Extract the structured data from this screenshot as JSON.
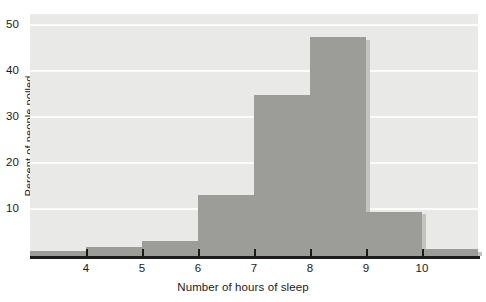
{
  "chart_data": {
    "type": "bar",
    "title": "",
    "xlabel": "Number of hours of sleep",
    "ylabel": "Percent of people polled",
    "categories": [
      "3-4",
      "4-5",
      "5-6",
      "6-7",
      "7-8",
      "8-9",
      "9-10",
      "10-11"
    ],
    "bin_edges": [
      3,
      4,
      5,
      6,
      7,
      8,
      9,
      10,
      11
    ],
    "values": [
      1,
      2,
      3.3,
      13.2,
      35,
      47.5,
      9.6,
      1.5
    ],
    "x_tick_labels": [
      "4",
      "5",
      "6",
      "7",
      "8",
      "9",
      "10"
    ],
    "x_tick_values": [
      4,
      5,
      6,
      7,
      8,
      9,
      10
    ],
    "y_tick_labels": [
      "10",
      "20",
      "30",
      "40",
      "50"
    ],
    "y_tick_values": [
      10,
      20,
      30,
      40,
      50
    ],
    "xlim": [
      3,
      11
    ],
    "ylim": [
      0,
      52.6
    ],
    "grid": "horizontal",
    "legend": "none",
    "bar_color": "#9c9c99",
    "bar_shadow_color": "#c3c3c0",
    "plot_background": "#e9e9e7",
    "gridline_color": "#fcfcfb",
    "axis_color": "#1b1b1b"
  }
}
